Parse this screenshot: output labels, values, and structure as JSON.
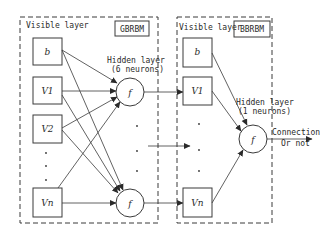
{
  "diagram": {
    "type": "stacked RBM network diagram",
    "left_panel": {
      "visible_layer_label": "Visible layer",
      "model_label": "GBRBM",
      "visible_units": [
        "b",
        "V1",
        "V2",
        "Vn"
      ],
      "hidden_layer_label": "Hidden layer",
      "hidden_layer_size": "(6 neurons)",
      "hidden_unit_symbol": "f"
    },
    "right_panel": {
      "visible_layer_label": "Visible layer",
      "model_label": "BBRBM",
      "visible_units": [
        "b",
        "V1",
        "Vn"
      ],
      "hidden_layer_label": "Hidden layer",
      "hidden_layer_size": "(1 neurons)",
      "hidden_unit_symbol": "f"
    },
    "output": {
      "line1": "Connection",
      "line2": "Or not"
    },
    "colors": {
      "stroke": "#3a3a3a",
      "background": "#ffffff"
    }
  }
}
